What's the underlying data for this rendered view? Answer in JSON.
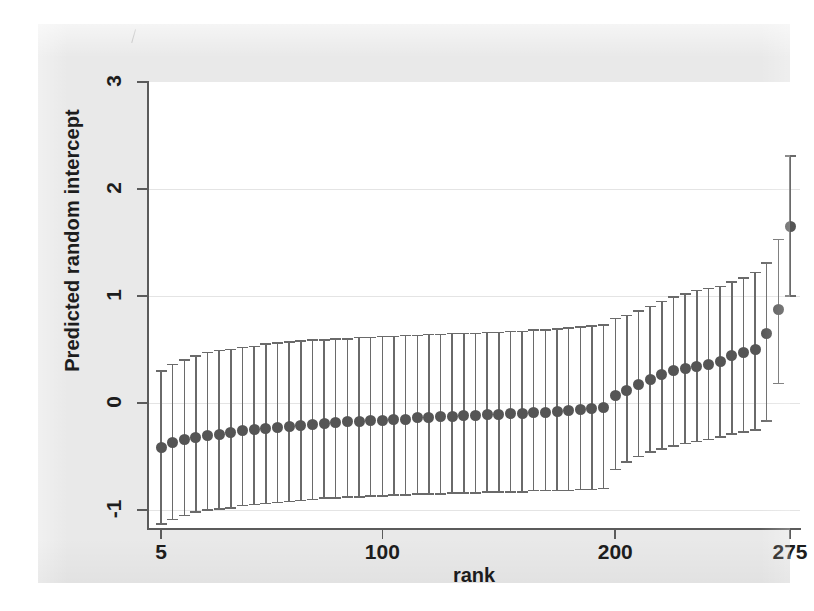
{
  "figure": {
    "background_color": "#e9e9e9",
    "plot_background_color": "#ffffff",
    "marker_color": "#555555",
    "errorbar_color": "#6a6a6a",
    "axis_color": "#5b5b5b",
    "grid_color": "#e4e4e4"
  },
  "chart_data": {
    "type": "scatter",
    "title": "",
    "subtitle": "",
    "xlabel": "rank",
    "ylabel": "Predicted random intercept",
    "xlim": [
      0,
      280
    ],
    "ylim": [
      -1.35,
      3.25
    ],
    "xticks": [
      5,
      100,
      200,
      275
    ],
    "xtick_labels": [
      "5",
      "100",
      "200",
      "275"
    ],
    "yticks": [
      -1,
      0,
      1,
      2,
      3
    ],
    "ytick_labels": [
      "-1",
      "0",
      "1",
      "2",
      "3"
    ],
    "grid": "horizontal-at-yticks",
    "legend": "none",
    "series_name": "Predicted random intercept with 95% CI",
    "errorbar_style": "capped-vertical",
    "x": [
      5,
      10,
      15,
      20,
      25,
      30,
      35,
      40,
      45,
      50,
      55,
      60,
      65,
      70,
      75,
      80,
      85,
      90,
      95,
      100,
      105,
      110,
      115,
      120,
      125,
      130,
      135,
      140,
      145,
      150,
      155,
      160,
      165,
      170,
      175,
      180,
      185,
      190,
      195,
      200,
      205,
      210,
      215,
      220,
      225,
      230,
      235,
      240,
      245,
      250,
      255,
      260,
      265,
      270,
      275
    ],
    "y": [
      -0.42,
      -0.37,
      -0.34,
      -0.32,
      -0.3,
      -0.29,
      -0.28,
      -0.26,
      -0.25,
      -0.24,
      -0.23,
      -0.22,
      -0.21,
      -0.2,
      -0.19,
      -0.18,
      -0.17,
      -0.17,
      -0.16,
      -0.16,
      -0.15,
      -0.15,
      -0.14,
      -0.14,
      -0.13,
      -0.13,
      -0.12,
      -0.12,
      -0.11,
      -0.11,
      -0.1,
      -0.1,
      -0.09,
      -0.09,
      -0.08,
      -0.07,
      -0.06,
      -0.05,
      -0.04,
      0.07,
      0.12,
      0.17,
      0.22,
      0.27,
      0.3,
      0.32,
      0.34,
      0.36,
      0.39,
      0.44,
      0.47,
      0.5,
      0.65,
      0.87,
      1.65
    ],
    "ci_low": [
      -1.13,
      -1.09,
      -1.05,
      -1.02,
      -1.0,
      -0.99,
      -0.98,
      -0.96,
      -0.95,
      -0.94,
      -0.93,
      -0.92,
      -0.91,
      -0.9,
      -0.89,
      -0.89,
      -0.88,
      -0.88,
      -0.87,
      -0.87,
      -0.86,
      -0.86,
      -0.85,
      -0.85,
      -0.85,
      -0.84,
      -0.84,
      -0.84,
      -0.83,
      -0.83,
      -0.83,
      -0.83,
      -0.82,
      -0.82,
      -0.82,
      -0.82,
      -0.81,
      -0.81,
      -0.8,
      -0.62,
      -0.55,
      -0.5,
      -0.46,
      -0.43,
      -0.4,
      -0.38,
      -0.36,
      -0.34,
      -0.32,
      -0.29,
      -0.27,
      -0.25,
      -0.17,
      0.18,
      1.0
    ],
    "ci_high": [
      0.3,
      0.36,
      0.4,
      0.44,
      0.47,
      0.49,
      0.5,
      0.52,
      0.53,
      0.55,
      0.56,
      0.57,
      0.58,
      0.59,
      0.59,
      0.6,
      0.6,
      0.61,
      0.61,
      0.62,
      0.62,
      0.63,
      0.63,
      0.64,
      0.64,
      0.65,
      0.65,
      0.65,
      0.66,
      0.66,
      0.67,
      0.67,
      0.68,
      0.68,
      0.69,
      0.7,
      0.71,
      0.72,
      0.73,
      0.79,
      0.82,
      0.86,
      0.9,
      0.95,
      0.99,
      1.02,
      1.05,
      1.07,
      1.09,
      1.13,
      1.17,
      1.22,
      1.31,
      1.53,
      2.31
    ]
  }
}
